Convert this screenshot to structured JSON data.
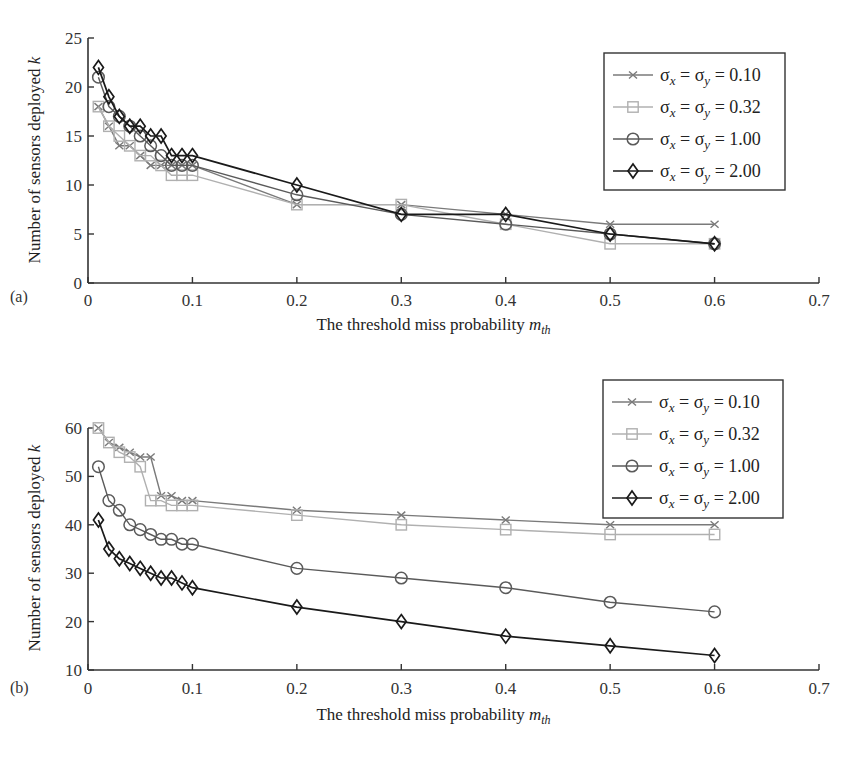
{
  "chart_data": [
    {
      "panel": "(a)",
      "type": "line",
      "title": "",
      "xlabel": "The threshold miss probability m_th",
      "ylabel": "Number of sensors deployed k",
      "xlim": [
        0,
        0.7
      ],
      "ylim": [
        0,
        25
      ],
      "xticks": [
        "0",
        "0.1",
        "0.2",
        "0.3",
        "0.4",
        "0.5",
        "0.6",
        "0.7"
      ],
      "yticks": [
        "0",
        "5",
        "10",
        "15",
        "20",
        "25"
      ],
      "grid": false,
      "legend_position": "upper right",
      "x": [
        0.01,
        0.02,
        0.03,
        0.04,
        0.05,
        0.06,
        0.07,
        0.08,
        0.09,
        0.1,
        0.2,
        0.3,
        0.4,
        0.5,
        0.6
      ],
      "series": [
        {
          "name": "σx = σy = 0.10",
          "marker": "x",
          "color": "#7a7a7a",
          "values": [
            18,
            16,
            14,
            14,
            13,
            12,
            12,
            12,
            12,
            12,
            8,
            8,
            7,
            6,
            6
          ]
        },
        {
          "name": "σx = σy = 0.32",
          "marker": "square",
          "color": "#b0b0b0",
          "values": [
            18,
            16,
            15,
            14,
            13,
            13,
            12,
            11,
            11,
            11,
            8,
            8,
            6,
            4,
            4
          ]
        },
        {
          "name": "σx = σy = 1.00",
          "marker": "circle",
          "color": "#5a5a5a",
          "values": [
            21,
            18,
            17,
            16,
            15,
            14,
            13,
            12,
            12,
            12,
            9,
            7,
            6,
            5,
            4
          ]
        },
        {
          "name": "σx = σy = 2.00",
          "marker": "diamond",
          "color": "#1a1a1a",
          "values": [
            22,
            19,
            17,
            16,
            16,
            15,
            15,
            13,
            13,
            13,
            10,
            7,
            7,
            5,
            4
          ]
        }
      ]
    },
    {
      "panel": "(b)",
      "type": "line",
      "title": "",
      "xlabel": "The threshold miss probability m_th",
      "ylabel": "Number of sensors deployed k",
      "xlim": [
        0,
        0.7
      ],
      "ylim": [
        10,
        60
      ],
      "xticks": [
        "0",
        "0.1",
        "0.2",
        "0.3",
        "0.4",
        "0.5",
        "0.6",
        "0.7"
      ],
      "yticks": [
        "10",
        "20",
        "30",
        "40",
        "50",
        "60"
      ],
      "grid": false,
      "legend_position": "upper right",
      "x": [
        0.01,
        0.02,
        0.03,
        0.04,
        0.05,
        0.06,
        0.07,
        0.08,
        0.09,
        0.1,
        0.2,
        0.3,
        0.4,
        0.5,
        0.6
      ],
      "series": [
        {
          "name": "σx = σy = 0.10",
          "marker": "x",
          "color": "#7a7a7a",
          "values": [
            60,
            57,
            56,
            55,
            54,
            54,
            46,
            46,
            45,
            45,
            43,
            42,
            41,
            40,
            40
          ]
        },
        {
          "name": "σx = σy = 0.32",
          "marker": "square",
          "color": "#b0b0b0",
          "values": [
            60,
            57,
            55,
            54,
            52,
            45,
            45,
            44,
            44,
            44,
            42,
            40,
            39,
            38,
            38
          ]
        },
        {
          "name": "σx = σy = 1.00",
          "marker": "circle",
          "color": "#5a5a5a",
          "values": [
            52,
            45,
            43,
            40,
            39,
            38,
            37,
            37,
            36,
            36,
            31,
            29,
            27,
            24,
            22
          ]
        },
        {
          "name": "σx = σy = 2.00",
          "marker": "diamond",
          "color": "#1a1a1a",
          "values": [
            41,
            35,
            33,
            32,
            31,
            30,
            29,
            29,
            28,
            27,
            23,
            20,
            17,
            15,
            13
          ]
        }
      ]
    }
  ],
  "labels": {
    "panel_a": "(a)",
    "panel_b": "(b)",
    "ylabel_main": "Number of sensors deployed ",
    "ylabel_var": "k",
    "xlabel_main": "The threshold miss probability ",
    "xlabel_var": "m",
    "xlabel_sub": "th"
  },
  "legend": [
    {
      "sigma_x": "σ",
      "sub_x": "x",
      "eq1": " = ",
      "sigma_y": "σ",
      "sub_y": "y",
      "eq2": " = ",
      "value": "0.10"
    },
    {
      "sigma_x": "σ",
      "sub_x": "x",
      "eq1": " = ",
      "sigma_y": "σ",
      "sub_y": "y",
      "eq2": " = ",
      "value": "0.32"
    },
    {
      "sigma_x": "σ",
      "sub_x": "x",
      "eq1": " = ",
      "sigma_y": "σ",
      "sub_y": "y",
      "eq2": " = ",
      "value": "1.00"
    },
    {
      "sigma_x": "σ",
      "sub_x": "x",
      "eq1": " = ",
      "sigma_y": "σ",
      "sub_y": "y",
      "eq2": " = ",
      "value": "2.00"
    }
  ]
}
